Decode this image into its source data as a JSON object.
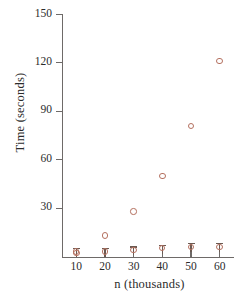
{
  "chart_data": {
    "type": "scatter",
    "title": "",
    "xlabel": "n (thousands)",
    "ylabel": "Time (seconds)",
    "xlim": [
      5,
      65
    ],
    "ylim": [
      0,
      150
    ],
    "grid": false,
    "legend": "none",
    "x": [
      10,
      20,
      30,
      40,
      50,
      60
    ],
    "xticks": [
      "10",
      "20",
      "30",
      "40",
      "50",
      "60"
    ],
    "yticks": [
      "30",
      "60",
      "90",
      "120",
      "150"
    ],
    "ytick_values": [
      30,
      60,
      90,
      120,
      150
    ],
    "marker_color": "#b4705f",
    "low_marker_color": "#6b5a52",
    "axis_color": "#6e6a68",
    "series": [
      {
        "name": "upper-series",
        "marker": "open-circle",
        "values": [
          2,
          13,
          28,
          50,
          81,
          121
        ]
      },
      {
        "name": "lower-series",
        "marker": "circle-with-bar",
        "values": [
          1,
          1,
          2,
          3,
          4,
          4
        ]
      }
    ]
  }
}
